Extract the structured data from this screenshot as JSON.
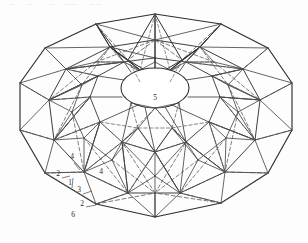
{
  "page": {
    "background_color": "#fdfdfd",
    "header_text": "· — ·· — ··· — · —— ·· —— ···"
  },
  "figure": {
    "name": "lamella-dome-schematic",
    "line_colors": {
      "solid_edge": "#3a3a3a",
      "hidden_edge": "#5a5a5a",
      "heavy_edge": "#222222"
    },
    "line_styles": {
      "visible": "solid",
      "hidden": "dashed"
    },
    "stroke_widths": {
      "thin": 0.7,
      "medium": 0.9,
      "heavy": 1.3
    },
    "dash_pattern": "4,2.6",
    "callouts": [
      {
        "id": "c1",
        "label": "1",
        "x": 70,
        "y": 185
      },
      {
        "id": "c2",
        "label": "2",
        "x": 58,
        "y": 176
      },
      {
        "id": "c3",
        "label": "3",
        "x": 79,
        "y": 192
      },
      {
        "id": "c4",
        "label": "4",
        "x": 72,
        "y": 159
      },
      {
        "id": "c5",
        "label": "4",
        "x": 101,
        "y": 174
      },
      {
        "id": "c6",
        "label": "2",
        "x": 82,
        "y": 206
      },
      {
        "id": "c7",
        "label": "6",
        "x": 73,
        "y": 217
      },
      {
        "id": "c8",
        "label": "5",
        "x": 155,
        "y": 100
      }
    ],
    "oculus": {
      "name": "central-oculus",
      "cx": 155,
      "cy": 88,
      "rx": 34,
      "ry": 20
    },
    "outer_ring": {
      "name": "outer-dodecagon",
      "sides": 12,
      "points": "155,14 219,23 268,48 292,82 292,131 268,174 219,205 155,218 96,205 44,174 20,131 20,82 44,48 96,23"
    },
    "ring_counts": {
      "outer_polygon_sides": 14,
      "radial_bays": 12,
      "tiers": 3
    }
  },
  "colors": {
    "ink": "#2b2b2b",
    "paper": "#fdfdfd",
    "faint": "#7a7a7a"
  }
}
